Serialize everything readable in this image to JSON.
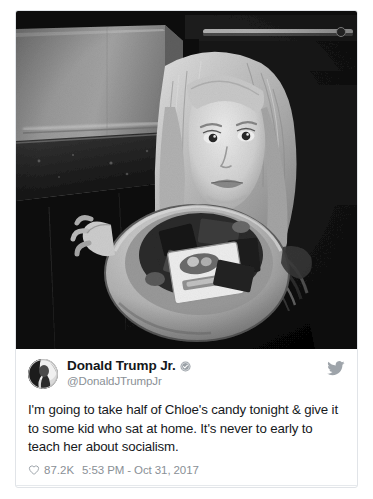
{
  "card": {
    "type": "embedded-tweet",
    "photo": {
      "alt": "Black and white photo of a young girl holding a large bowl of Halloween candy in a kitchen",
      "is_grayscale": true
    },
    "author": {
      "display_name": "Donald Trump Jr.",
      "handle": "@DonaldJTrumpJr",
      "verified": true,
      "verified_icon": "verified-badge-icon",
      "avatar_icon": "avatar-image"
    },
    "brand_icon": "twitter-bird-icon",
    "text": "I'm going to take half of Chloe's candy tonight & give it to some kid who sat at home. It's never to early to teach her about socialism.",
    "metrics": {
      "like_icon": "heart-icon",
      "like_count": "87.2K",
      "timestamp": "5:53 PM - Oct 31, 2017"
    },
    "footer": {
      "reply_icon": "comment-bubble-icon",
      "label": "105K people are talking about this",
      "chevron_icon": "chevron-right-icon"
    }
  },
  "colors": {
    "page_background": "#ffffff",
    "card_border": "#e1e4e8",
    "text_primary": "#16191c",
    "text_muted": "#8a9096",
    "divider": "#e6e9ec"
  }
}
